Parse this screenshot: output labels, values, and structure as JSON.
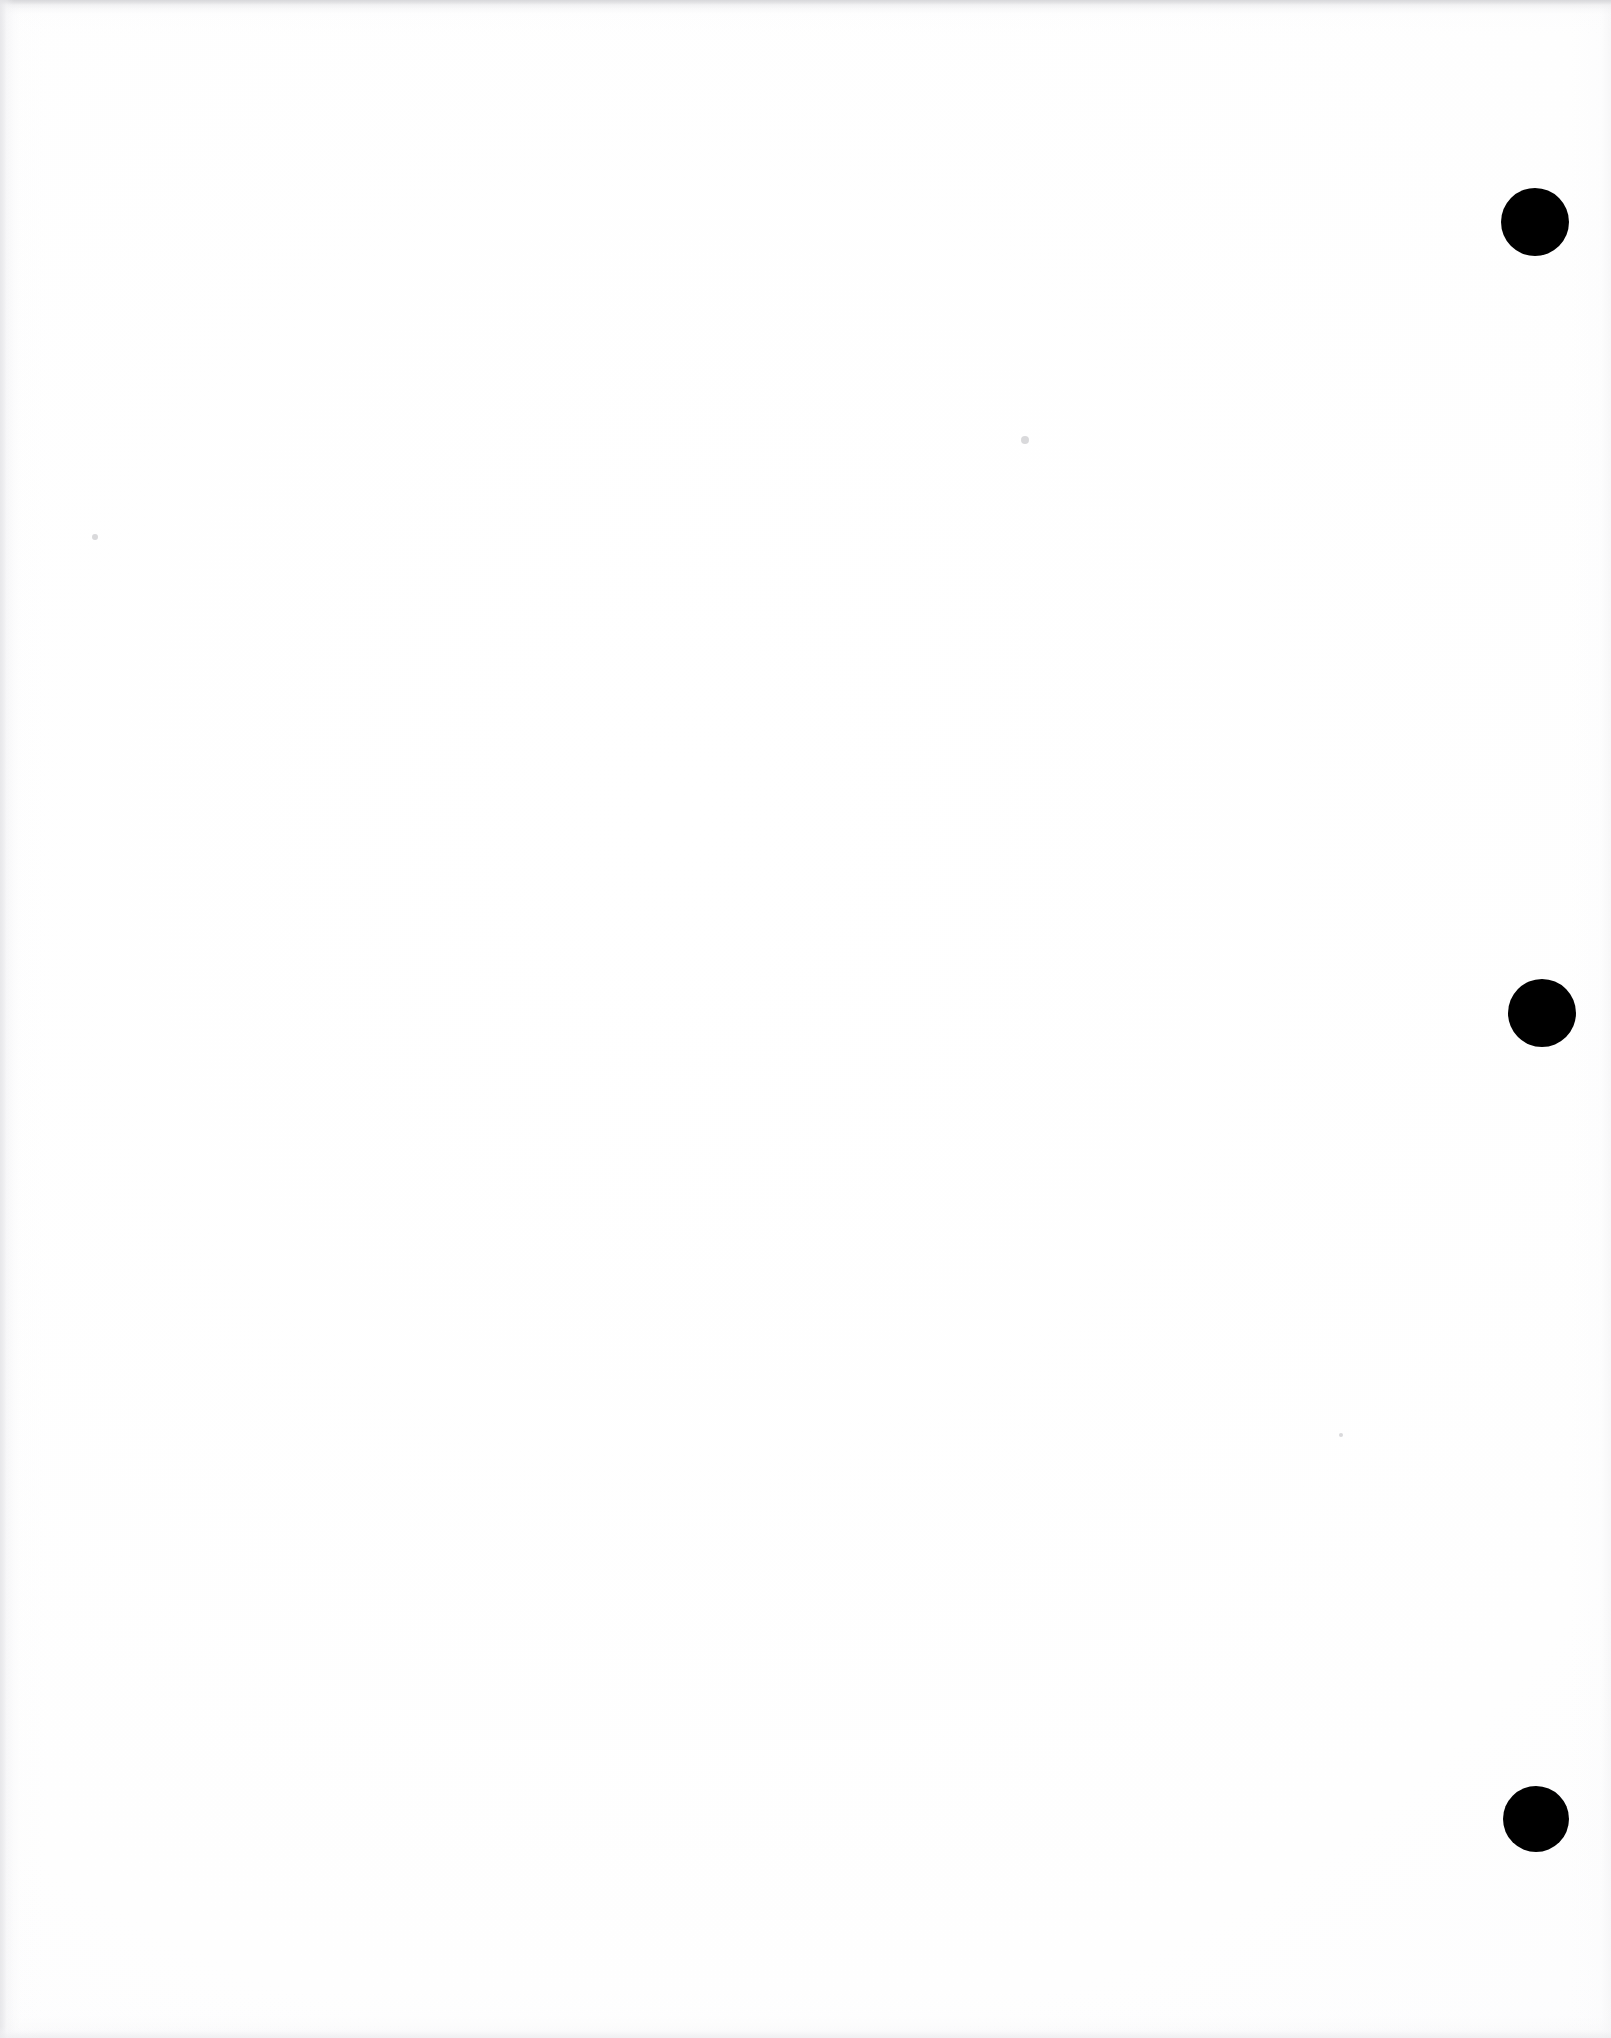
{
  "document": {
    "kind": "scanned-page",
    "page_label": "",
    "width_px": 1611,
    "height_px": 2038,
    "background_color": "#ffffff",
    "ink_color": "#000000",
    "body_text": "",
    "note": "Blank scanned page with three binder punch holes along the right margin"
  },
  "punch_holes": [
    {
      "name": "punch-hole-top",
      "center_x": 1535,
      "center_y": 222,
      "radius": 34,
      "color": "#000000"
    },
    {
      "name": "punch-hole-middle",
      "center_x": 1542,
      "center_y": 1013,
      "radius": 34,
      "color": "#000000"
    },
    {
      "name": "punch-hole-bottom",
      "center_x": 1536,
      "center_y": 1819,
      "radius": 33,
      "color": "#000000"
    }
  ],
  "specks": [
    {
      "name": "speck-left",
      "center_x": 95,
      "center_y": 537,
      "radius": 3,
      "color": "#babdbe"
    },
    {
      "name": "speck-upper",
      "center_x": 1025,
      "center_y": 440,
      "radius": 4,
      "color": "#babdbe"
    },
    {
      "name": "speck-right",
      "center_x": 1341,
      "center_y": 1435,
      "radius": 2,
      "color": "#c9c9cc"
    }
  ],
  "scan_edges": {
    "top_band_color": "#d6d6d9",
    "left_band_color": "#e7e7ea",
    "bottom_band_color": "#eeeef0",
    "right_band_color": "#f0f0f2"
  }
}
